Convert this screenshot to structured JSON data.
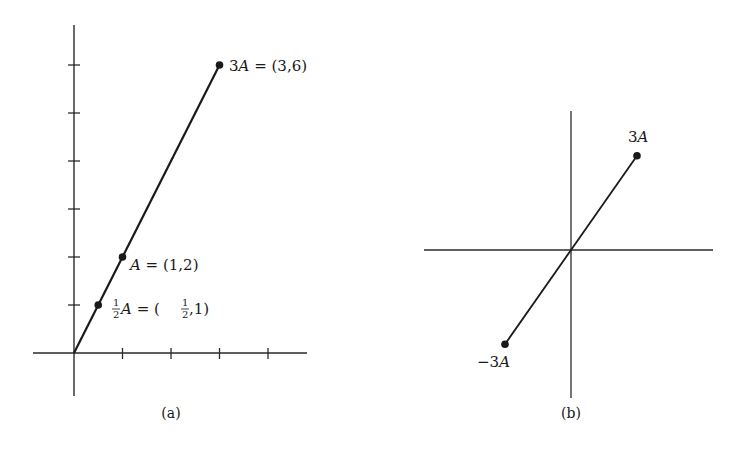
{
  "figure_a": {
    "caption": "(a)",
    "x_ticks": [
      1,
      2,
      3,
      4
    ],
    "y_ticks": [
      1,
      2,
      3,
      4,
      5,
      6
    ],
    "segment": {
      "from": [
        0,
        0
      ],
      "to": [
        3,
        6
      ]
    },
    "points": [
      {
        "name": "half-A",
        "x": 0.5,
        "y": 1,
        "label_prefix_num": "1",
        "label_prefix_den": "2",
        "label_var": "A",
        "label_eq": " = (",
        "label_frac_num": "1",
        "label_frac_den": "2",
        "label_tail": ",1)"
      },
      {
        "name": "A",
        "x": 1,
        "y": 2,
        "label_var": "A",
        "label_rest": " = (1,2)"
      },
      {
        "name": "3A",
        "x": 3,
        "y": 6,
        "label_coef": "3",
        "label_var": "A",
        "label_rest": " = (3,6)"
      }
    ]
  },
  "figure_b": {
    "caption": "(b)",
    "segment": {
      "from": [
        -3,
        -6
      ],
      "to": [
        3,
        6
      ]
    },
    "points": [
      {
        "name": "3A",
        "x": 3,
        "y": 6,
        "label_coef": "3",
        "label_var": "A"
      },
      {
        "name": "neg-3A",
        "x": -3,
        "y": -6,
        "label_coef": "−3",
        "label_var": "A"
      }
    ]
  },
  "chart_data": [
    {
      "type": "line",
      "title": "(a)",
      "xlabel": "",
      "ylabel": "",
      "xlim": [
        0,
        4
      ],
      "ylim": [
        0,
        6
      ],
      "series": [
        {
          "name": "tA",
          "x": [
            0,
            0.5,
            1,
            3
          ],
          "y": [
            0,
            1,
            2,
            6
          ]
        }
      ],
      "annotations": [
        "½A = (½,1)",
        "A = (1,2)",
        "3A = (3,6)"
      ],
      "grid": false
    },
    {
      "type": "line",
      "title": "(b)",
      "series": [
        {
          "name": "tA",
          "x": [
            -3,
            3
          ],
          "y": [
            -6,
            6
          ]
        }
      ],
      "annotations": [
        "3A",
        "−3A"
      ],
      "grid": false
    }
  ]
}
